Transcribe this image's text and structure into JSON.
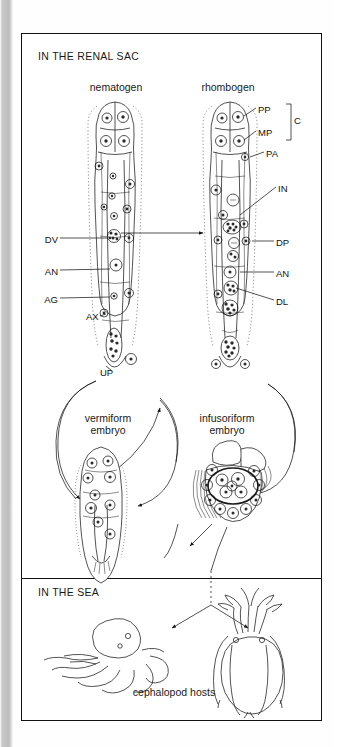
{
  "figure": {
    "type": "biological-life-cycle-diagram",
    "sections": [
      {
        "id": "renal",
        "label": "IN THE RENAL SAC"
      },
      {
        "id": "sea",
        "label": "IN THE SEA"
      }
    ],
    "stages": {
      "nematogen": {
        "title": "nematogen"
      },
      "rhombogen": {
        "title": "rhombogen"
      },
      "vermiform": {
        "title_line1": "vermiform",
        "title_line2": "embryo"
      },
      "infusoriform": {
        "title_line1": "infusoriform",
        "title_line2": "embryo"
      }
    },
    "hosts": {
      "caption": "cephalopod hosts",
      "animals": [
        "octopus",
        "squid"
      ]
    },
    "labels_left": [
      {
        "code": "DV",
        "meaning": "developing vermiform embryo"
      },
      {
        "code": "AN",
        "meaning": "axial cell nucleus"
      },
      {
        "code": "AG",
        "meaning": "agamete"
      },
      {
        "code": "AX",
        "meaning": "axial cell"
      },
      {
        "code": "UP",
        "meaning": "uropolar cell"
      }
    ],
    "labels_right": [
      {
        "code": "PP",
        "meaning": "propolar cell"
      },
      {
        "code": "MP",
        "meaning": "metapolar cell"
      },
      {
        "code": "C",
        "meaning": "calotte"
      },
      {
        "code": "PA",
        "meaning": "parapolar cell"
      },
      {
        "code": "IN",
        "meaning": "infusorigen"
      },
      {
        "code": "DP",
        "meaning": "developing infusoriform embryo"
      },
      {
        "code": "AN",
        "meaning": "axial cell nucleus"
      },
      {
        "code": "DL",
        "meaning": "developing infusoriform larva"
      }
    ],
    "colors": {
      "ink": "#1a1a1a",
      "paper": "#ffffff",
      "gutter": "#bdbdbd"
    }
  }
}
